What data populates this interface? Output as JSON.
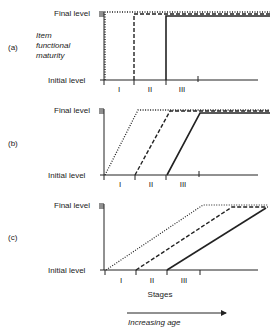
{
  "figure": {
    "y_label_lines": [
      "Item",
      "functional",
      "maturity"
    ],
    "final_level": "Final level",
    "initial_level": "Initial level",
    "stage_labels": [
      "I",
      "II",
      "III"
    ],
    "x_label": "Stages",
    "age_arrow_label": "Increasing age",
    "panels": [
      {
        "id": "(a)",
        "shape": "step"
      },
      {
        "id": "(b)",
        "shape": "steep ramp"
      },
      {
        "id": "(c)",
        "shape": "gradual ramp"
      }
    ],
    "line_styles": [
      "dotted (stage I)",
      "dashed (stage II)",
      "solid (stage III)"
    ]
  }
}
